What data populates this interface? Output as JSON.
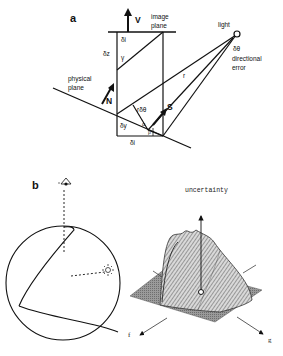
{
  "panel_a": {
    "label": "a",
    "v_label": "V",
    "image_plane_line1": "image",
    "image_plane_line2": "plane",
    "light_label": "light",
    "delta_theta": "δθ",
    "directional_line1": "directional",
    "directional_line2": "error",
    "delta_i_top": "δi",
    "delta_z": "δz",
    "gamma": "γ",
    "physical_line1": "physical",
    "physical_line2": "plane",
    "n_label": "N",
    "r_label": "r",
    "r_delta_theta": "rδθ",
    "s_label": "S",
    "delta_y": "δy",
    "alpha": "α",
    "beta": "β",
    "delta_i_bottom": "δi"
  },
  "panel_b": {
    "label": "b",
    "uncertainty_label": "uncertainty",
    "f_label": "f",
    "g_label": "g",
    "eye_icon": "eye-icon",
    "light_icon": "sun-icon"
  }
}
